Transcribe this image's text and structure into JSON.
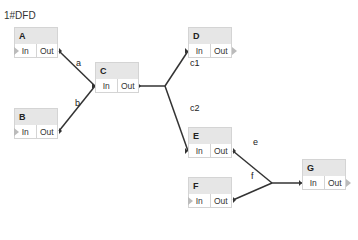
{
  "title": "1#DFD",
  "nodes": {
    "A": {
      "label": "A",
      "in": "In",
      "out": "Out"
    },
    "B": {
      "label": "B",
      "in": "In",
      "out": "Out"
    },
    "C": {
      "label": "C",
      "in": "In",
      "out": "Out"
    },
    "D": {
      "label": "D",
      "in": "In",
      "out": "Out"
    },
    "E": {
      "label": "E",
      "in": "In",
      "out": "Out"
    },
    "F": {
      "label": "F",
      "in": "In",
      "out": "Out"
    },
    "G": {
      "label": "G",
      "in": "In",
      "out": "Out"
    }
  },
  "edges": {
    "a": "a",
    "b": "b",
    "c1": "c1",
    "c2": "c2",
    "e": "e",
    "f": "f"
  }
}
